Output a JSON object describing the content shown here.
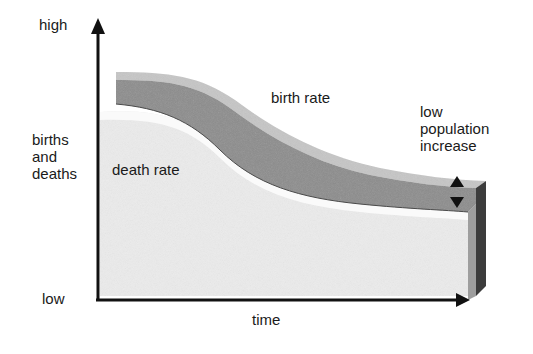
{
  "diagram": {
    "type": "demographic-transition",
    "y_axis": {
      "label": "births and deaths",
      "label_lines": [
        "births",
        "and",
        "deaths"
      ],
      "top": "high",
      "bottom": "low"
    },
    "x_axis": {
      "label": "time"
    },
    "curves": {
      "birth_rate": {
        "label": "birth rate"
      },
      "death_rate": {
        "label": "death rate"
      }
    },
    "annotation": {
      "lines": [
        "low",
        "population",
        "increase"
      ]
    },
    "colors": {
      "birth_band": "#8a8a8a",
      "birth_top": "#c4c4c4",
      "death_area": "#ececec",
      "death_top": "#f8f8f8",
      "axis": "#111111",
      "side_dark": "#3a3a3a",
      "side_mid": "#9a9a9a"
    }
  }
}
